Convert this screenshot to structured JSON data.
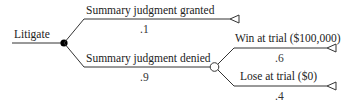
{
  "diagram": {
    "type": "decision-tree",
    "root": {
      "label": "Litigate",
      "node_type": "decision"
    },
    "branches": [
      {
        "label": "Summary judgment granted",
        "probability": ".1",
        "end": "terminal"
      },
      {
        "label": "Summary judgment denied",
        "probability": ".9",
        "end": "chance",
        "branches": [
          {
            "label": "Win at trial ($100,000)",
            "probability": ".6",
            "end": "terminal"
          },
          {
            "label": "Lose at trial ($0)",
            "probability": ".4",
            "end": "terminal"
          }
        ]
      }
    ],
    "colors": {
      "line": "#333333",
      "decision_node": "#000000",
      "chance_node_fill": "#ffffff"
    }
  }
}
